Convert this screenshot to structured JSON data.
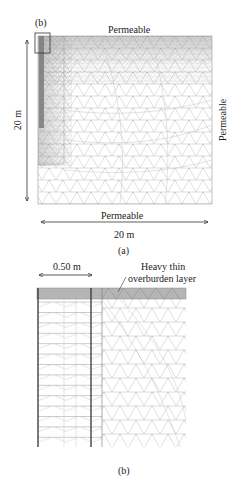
{
  "figure_a": {
    "inset_label": "(b)",
    "top_boundary": "Permeable",
    "right_boundary": "Permeable",
    "bottom_boundary": "Permeable",
    "height_dimension": "20 m",
    "width_dimension": "20 m",
    "caption": "(a)"
  },
  "figure_b": {
    "width_dimension": "0.50 m",
    "annotation_line1": "Heavy thin",
    "annotation_line2": "overburden layer",
    "caption": "(b)"
  },
  "colors": {
    "mesh_line": "#b8b8b8",
    "dense_mesh": "#8a8a8a",
    "overburden_fill": "#b5b5b5",
    "drain_line": "#333333",
    "text": "#222222"
  }
}
